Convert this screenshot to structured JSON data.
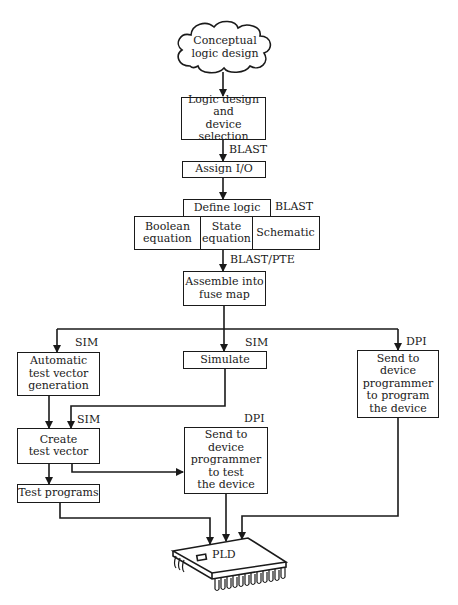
{
  "diagram": {
    "type": "flowchart",
    "start": {
      "label": "Conceptual\nlogic design",
      "shape": "cloud"
    },
    "nodes": {
      "logic_design": {
        "label": "Logic design\nand\ndevice selection"
      },
      "assign_io": {
        "label": "Assign I/O"
      },
      "define_logic": {
        "label": "Define logic"
      },
      "boolean": {
        "label": "Boolean\nequation"
      },
      "state": {
        "label": "State\nequation"
      },
      "schematic": {
        "label": "Schematic"
      },
      "assemble": {
        "label": "Assemble into\nfuse map"
      },
      "auto_tvg": {
        "label": "Automatic\ntest vector\ngeneration"
      },
      "simulate": {
        "label": "Simulate"
      },
      "dpi_program": {
        "label": "Send to\ndevice\nprogrammer\nto program\nthe device"
      },
      "create_tv": {
        "label": "Create\ntest vector"
      },
      "dpi_test": {
        "label": "Send to\ndevice\nprogrammer\nto test\nthe device"
      },
      "test_programs": {
        "label": "Test programs"
      },
      "pld": {
        "label": "PLD",
        "shape": "chip"
      }
    },
    "tags": {
      "blast_assign": "BLAST",
      "blast_define": "BLAST",
      "blast_pte": "BLAST/PTE",
      "sim_auto": "SIM",
      "sim_simulate": "SIM",
      "sim_create": "SIM",
      "dpi_right": "DPI",
      "dpi_mid": "DPI"
    },
    "edges": [
      [
        "Conceptual logic design",
        "Logic design and device selection"
      ],
      [
        "Logic design and device selection",
        "Assign I/O",
        "BLAST"
      ],
      [
        "Assign I/O",
        "Define logic"
      ],
      [
        "Define logic",
        "Assemble into fuse map",
        "BLAST/PTE"
      ],
      [
        "Assemble into fuse map",
        "Automatic test vector generation",
        "SIM"
      ],
      [
        "Assemble into fuse map",
        "Simulate",
        "SIM"
      ],
      [
        "Assemble into fuse map",
        "Send to device programmer to program the device",
        "DPI"
      ],
      [
        "Automatic test vector generation",
        "Create test vector"
      ],
      [
        "Simulate",
        "Create test vector",
        "SIM"
      ],
      [
        "Create test vector",
        "Send to device programmer to test the device",
        "DPI"
      ],
      [
        "Create test vector",
        "Test programs"
      ],
      [
        "Test programs",
        "PLD"
      ],
      [
        "Send to device programmer to test the device",
        "PLD"
      ],
      [
        "Send to device programmer to program the device",
        "PLD"
      ]
    ]
  }
}
